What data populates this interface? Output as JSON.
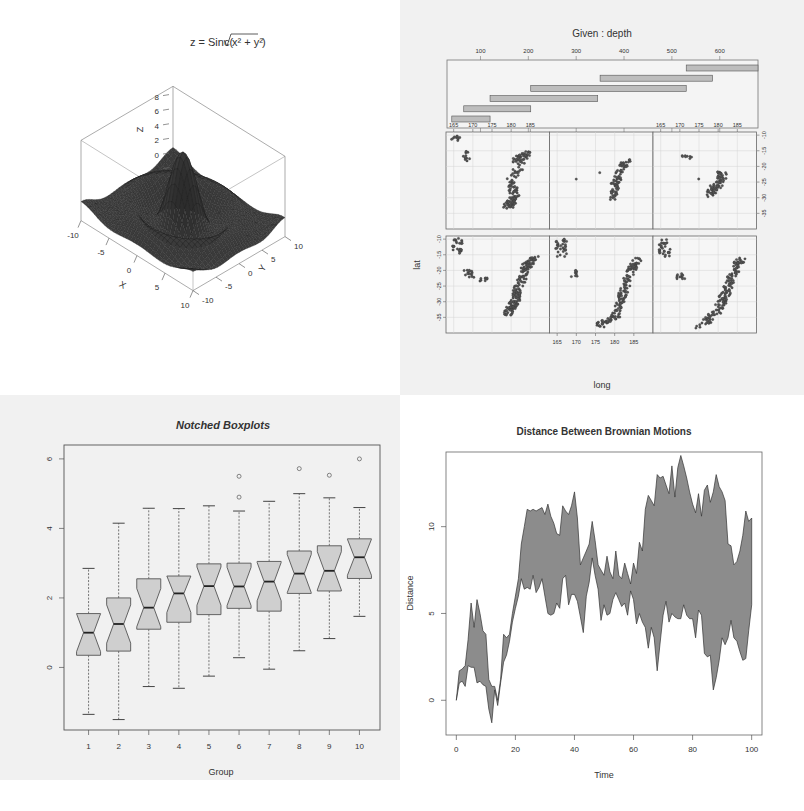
{
  "chart_data": [
    {
      "id": "perspective",
      "type": "surface3d",
      "title": "z = Sinc(√(x² + y²))",
      "title_parts": {
        "lhs": "z = Sinc(",
        "rad": "x² + y²",
        "rhs": ")"
      },
      "xlabel": "X",
      "ylabel": "Y",
      "zlabel": "Z",
      "x_ticks": [
        "-10",
        "-5",
        "0",
        "5",
        "10"
      ],
      "y_ticks": [
        "-10",
        "-5",
        "0",
        "5",
        "10"
      ],
      "z_ticks": [
        "-2",
        "0",
        "2",
        "4",
        "6",
        "8"
      ],
      "xlim": [
        -10,
        10
      ],
      "ylim": [
        -10,
        10
      ],
      "zlim": [
        -2,
        9
      ],
      "surface_color": "#3a3a3a"
    },
    {
      "id": "coplot",
      "type": "scatter",
      "title": "Given : depth",
      "given_ticks": [
        "100",
        "200",
        "300",
        "400",
        "500",
        "600"
      ],
      "given_intervals": [
        [
          40,
          120
        ],
        [
          65,
          205
        ],
        [
          120,
          345
        ],
        [
          205,
          530
        ],
        [
          350,
          585
        ],
        [
          530,
          680
        ]
      ],
      "xlabel": "long",
      "ylabel": "lat",
      "x_ticks": [
        "165",
        "170",
        "175",
        "180",
        "185"
      ],
      "y_ticks": [
        "-10",
        "-15",
        "-20",
        "-25",
        "-30",
        "-35"
      ],
      "layout": {
        "rows": 2,
        "cols": 3
      },
      "panels": [
        {
          "row": 2,
          "col": 1,
          "desc": "depth 40-120"
        },
        {
          "row": 2,
          "col": 2,
          "desc": "depth 65-205"
        },
        {
          "row": 2,
          "col": 3,
          "desc": "depth 120-345"
        },
        {
          "row": 1,
          "col": 1,
          "desc": "depth 205-530"
        },
        {
          "row": 1,
          "col": 2,
          "desc": "depth 350-585"
        },
        {
          "row": 1,
          "col": 3,
          "desc": "depth 530-680"
        }
      ]
    },
    {
      "id": "boxplot",
      "type": "boxplot",
      "title": "Notched Boxplots",
      "xlabel": "Group",
      "ylabel": "",
      "categories": [
        "1",
        "2",
        "3",
        "4",
        "5",
        "6",
        "7",
        "8",
        "9",
        "10"
      ],
      "y_ticks": [
        "0",
        "2",
        "4",
        "6"
      ],
      "ylim": [
        -1.8,
        6.4
      ],
      "boxes": [
        {
          "min": -1.35,
          "q1": 0.35,
          "median": 1.0,
          "q3": 1.55,
          "max": 2.85,
          "outliers": []
        },
        {
          "min": -1.5,
          "q1": 0.47,
          "median": 1.25,
          "q3": 2.0,
          "max": 4.15,
          "outliers": []
        },
        {
          "min": -0.55,
          "q1": 1.1,
          "median": 1.72,
          "q3": 2.55,
          "max": 4.58,
          "outliers": []
        },
        {
          "min": -0.6,
          "q1": 1.3,
          "median": 2.13,
          "q3": 2.63,
          "max": 4.57,
          "outliers": []
        },
        {
          "min": -0.25,
          "q1": 1.52,
          "median": 2.34,
          "q3": 2.98,
          "max": 4.65,
          "outliers": []
        },
        {
          "min": 0.28,
          "q1": 1.7,
          "median": 2.33,
          "q3": 3.0,
          "max": 4.5,
          "outliers": [
            4.9,
            5.5
          ]
        },
        {
          "min": -0.05,
          "q1": 1.62,
          "median": 2.47,
          "q3": 3.05,
          "max": 4.78,
          "outliers": []
        },
        {
          "min": 0.48,
          "q1": 2.13,
          "median": 2.7,
          "q3": 3.35,
          "max": 5.0,
          "outliers": [
            5.72
          ]
        },
        {
          "min": 0.83,
          "q1": 2.2,
          "median": 2.78,
          "q3": 3.5,
          "max": 4.88,
          "outliers": [
            5.53
          ]
        },
        {
          "min": 1.47,
          "q1": 2.56,
          "median": 3.17,
          "q3": 3.7,
          "max": 4.6,
          "outliers": [
            6.0
          ]
        }
      ],
      "box_fill": "#cfcfcf"
    },
    {
      "id": "brownian",
      "type": "area",
      "title": "Distance Between Brownian Motions",
      "xlabel": "Time",
      "ylabel": "Distance",
      "x_ticks": [
        "0",
        "20",
        "40",
        "60",
        "80",
        "100"
      ],
      "y_ticks": [
        "0",
        "5",
        "10"
      ],
      "xlim": [
        0,
        100
      ],
      "ylim": [
        -2,
        14
      ],
      "x": [
        0,
        1,
        2,
        3,
        4,
        5,
        6,
        7,
        8,
        9,
        10,
        11,
        12,
        13,
        14,
        15,
        16,
        17,
        18,
        19,
        20,
        21,
        22,
        23,
        24,
        25,
        26,
        27,
        28,
        29,
        30,
        31,
        32,
        33,
        34,
        35,
        36,
        37,
        38,
        39,
        40,
        41,
        42,
        43,
        44,
        45,
        46,
        47,
        48,
        49,
        50,
        51,
        52,
        53,
        54,
        55,
        56,
        57,
        58,
        59,
        60,
        61,
        62,
        63,
        64,
        65,
        66,
        67,
        68,
        69,
        70,
        71,
        72,
        73,
        74,
        75,
        76,
        77,
        78,
        79,
        80,
        81,
        82,
        83,
        84,
        85,
        86,
        87,
        88,
        89,
        90,
        91,
        92,
        93,
        94,
        95,
        96,
        97,
        98,
        99,
        100
      ],
      "upper": [
        0,
        1.7,
        1.8,
        2.0,
        3.5,
        5.6,
        4.2,
        5.8,
        5.0,
        4.0,
        3.8,
        1.2,
        0.8,
        0.8,
        0.0,
        1.2,
        3.8,
        3.6,
        3.8,
        5.0,
        6.0,
        7.0,
        9.0,
        10.0,
        11.0,
        10.9,
        11.0,
        10.9,
        11.0,
        11.1,
        10.7,
        11.3,
        10.6,
        10.2,
        9.6,
        9.5,
        11.2,
        10.9,
        10.7,
        11.2,
        12.0,
        10.5,
        7.8,
        8.2,
        8.6,
        9.0,
        10.3,
        9.2,
        7.8,
        7.5,
        7.2,
        8.3,
        7.4,
        7.0,
        8.6,
        7.2,
        7.0,
        7.9,
        7.3,
        6.7,
        7.9,
        7.3,
        9.1,
        8.6,
        11.0,
        11.8,
        11.5,
        11.2,
        13.0,
        12.8,
        12.9,
        12.4,
        11.9,
        13.5,
        11.7,
        13.4,
        14.1,
        13.5,
        12.8,
        12.0,
        11.3,
        10.8,
        11.9,
        10.6,
        12.1,
        12.4,
        11.4,
        12.0,
        13.0,
        12.3,
        12.0,
        11.5,
        9.0,
        8.9,
        7.8,
        8.0,
        8.6,
        9.5,
        10.9,
        10.3,
        10.5
      ],
      "lower": [
        0,
        1.0,
        1.1,
        0.8,
        2.0,
        1.9,
        1.9,
        1.0,
        1.1,
        0.9,
        0.8,
        -0.5,
        -1.3,
        0.6,
        -0.3,
        1.0,
        2.2,
        2.6,
        3.4,
        4.5,
        5.3,
        6.0,
        7.0,
        6.4,
        6.5,
        6.4,
        7.2,
        6.2,
        6.5,
        7.0,
        6.0,
        5.0,
        4.9,
        5.0,
        5.6,
        5.3,
        7.0,
        7.2,
        5.5,
        6.1,
        6.1,
        5.7,
        4.8,
        3.9,
        6.0,
        6.8,
        8.2,
        7.2,
        6.4,
        4.6,
        5.5,
        4.9,
        5.0,
        5.8,
        6.2,
        5.8,
        5.4,
        5.6,
        4.9,
        6.3,
        5.8,
        4.4,
        5.0,
        4.5,
        4.2,
        3.0,
        4.2,
        3.6,
        1.7,
        3.3,
        4.9,
        5.7,
        4.5,
        5.0,
        4.8,
        4.7,
        4.7,
        5.5,
        4.9,
        4.7,
        4.7,
        3.6,
        5.2,
        4.9,
        2.7,
        2.5,
        2.6,
        0.6,
        1.3,
        2.3,
        3.6,
        3.2,
        3.6,
        4.6,
        3.6,
        3.4,
        2.8,
        2.3,
        2.4,
        4.0,
        5.5
      ],
      "fill": "#8c8c8c"
    }
  ]
}
